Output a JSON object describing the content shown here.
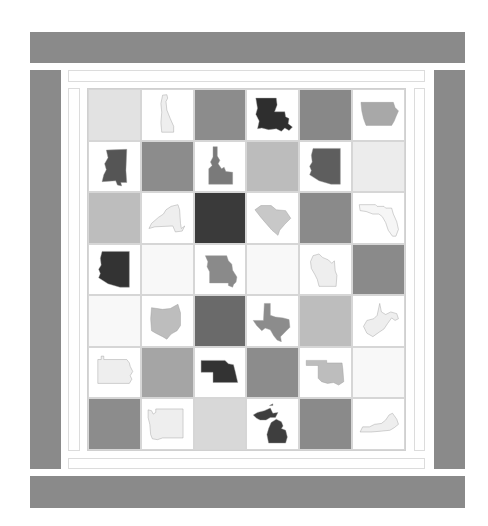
{
  "colors": {
    "frame": "#8a8a8a",
    "white": "#ffffff",
    "very_light": "#eeeeee",
    "light": "#e0e0e0",
    "light_mid": "#bdbdbd",
    "mid": "#8c8c8c",
    "dark_mid": "#6a6a6a",
    "dark": "#3a3a3a"
  },
  "grid": {
    "rows": 7,
    "cols": 6,
    "cells": [
      {
        "bg": "#e2e2e2",
        "state": ""
      },
      {
        "bg": "#ffffff",
        "state": "delaware",
        "fill": "#eeeeee"
      },
      {
        "bg": "#8c8c8c",
        "state": ""
      },
      {
        "bg": "#ffffff",
        "state": "louisiana",
        "fill": "#2e2e2e"
      },
      {
        "bg": "#888888",
        "state": ""
      },
      {
        "bg": "#ffffff",
        "state": "iowa",
        "fill": "#a8a8a8"
      },
      {
        "bg": "#ffffff",
        "state": "mississippi",
        "fill": "#555555"
      },
      {
        "bg": "#8c8c8c",
        "state": ""
      },
      {
        "bg": "#ffffff",
        "state": "idaho",
        "fill": "#7a7a7a"
      },
      {
        "bg": "#bcbcbc",
        "state": ""
      },
      {
        "bg": "#ffffff",
        "state": "arizona",
        "fill": "#5e5e5e"
      },
      {
        "bg": "#ececec",
        "state": ""
      },
      {
        "bg": "#bdbdbd",
        "state": ""
      },
      {
        "bg": "#ffffff",
        "state": "new-york",
        "fill": "#eeeeee"
      },
      {
        "bg": "#3a3a3a",
        "state": ""
      },
      {
        "bg": "#ffffff",
        "state": "south-carolina",
        "fill": "#c8c8c8"
      },
      {
        "bg": "#8a8a8a",
        "state": ""
      },
      {
        "bg": "#ffffff",
        "state": "florida",
        "fill": "#f6f6f6"
      },
      {
        "bg": "#ffffff",
        "state": "arizona",
        "fill": "#333333"
      },
      {
        "bg": "#f8f8f8",
        "state": ""
      },
      {
        "bg": "#ffffff",
        "state": "missouri",
        "fill": "#8a8a8a"
      },
      {
        "bg": "#f8f8f8",
        "state": ""
      },
      {
        "bg": "#ffffff",
        "state": "wisconsin",
        "fill": "#eeeeee"
      },
      {
        "bg": "#8a8a8a",
        "state": ""
      },
      {
        "bg": "#f8f8f8",
        "state": ""
      },
      {
        "bg": "#ffffff",
        "state": "ohio",
        "fill": "#bdbdbd"
      },
      {
        "bg": "#6a6a6a",
        "state": ""
      },
      {
        "bg": "#ffffff",
        "state": "texas",
        "fill": "#8c8c8c"
      },
      {
        "bg": "#bdbdbd",
        "state": ""
      },
      {
        "bg": "#ffffff",
        "state": "west-virginia",
        "fill": "#eeeeee"
      },
      {
        "bg": "#ffffff",
        "state": "pennsylvania",
        "fill": "#eeeeee"
      },
      {
        "bg": "#a5a5a5",
        "state": ""
      },
      {
        "bg": "#ffffff",
        "state": "nebraska",
        "fill": "#333333"
      },
      {
        "bg": "#8c8c8c",
        "state": ""
      },
      {
        "bg": "#ffffff",
        "state": "oklahoma",
        "fill": "#bdbdbd"
      },
      {
        "bg": "#f8f8f8",
        "state": ""
      },
      {
        "bg": "#8c8c8c",
        "state": ""
      },
      {
        "bg": "#ffffff",
        "state": "washington",
        "fill": "#eeeeee"
      },
      {
        "bg": "#d8d8d8",
        "state": ""
      },
      {
        "bg": "#ffffff",
        "state": "michigan",
        "fill": "#3e3e3e"
      },
      {
        "bg": "#8a8a8a",
        "state": ""
      },
      {
        "bg": "#ffffff",
        "state": "kentucky",
        "fill": "#eeeeee"
      }
    ]
  }
}
